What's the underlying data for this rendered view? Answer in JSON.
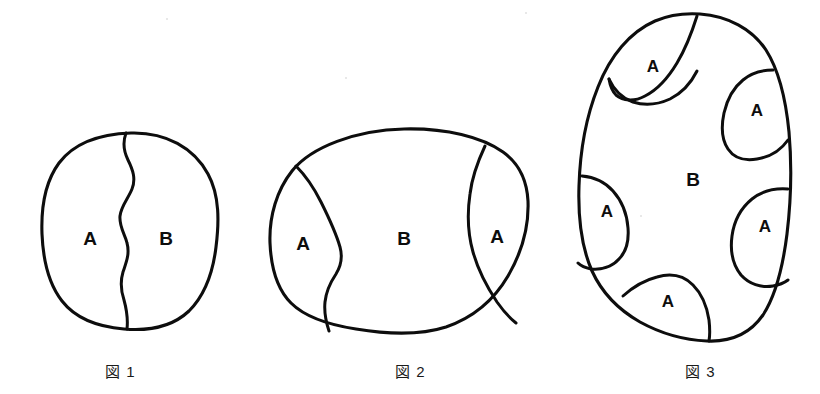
{
  "page": {
    "background_color": "#ffffff",
    "ink_color": "#0d0d0d",
    "width": 820,
    "height": 394
  },
  "figures": [
    {
      "id": "figure-1",
      "caption": "図 1",
      "caption_x": 105,
      "caption_y": 360,
      "shape": "rounded-blob",
      "regions": [
        {
          "label": "A",
          "x": 90,
          "y": 240
        },
        {
          "label": "B",
          "x": 166,
          "y": 240
        }
      ],
      "divider_count": 1,
      "description": "単一の波状境界で A と B の二領域に分割"
    },
    {
      "id": "figure-2",
      "caption": "図 2",
      "caption_x": 395,
      "caption_y": 360,
      "shape": "wide-oval-blob",
      "regions": [
        {
          "label": "A",
          "x": 303,
          "y": 245
        },
        {
          "label": "B",
          "x": 404,
          "y": 240
        },
        {
          "label": "A",
          "x": 497,
          "y": 238
        }
      ],
      "divider_count": 2,
      "description": "二本の境界で左右に A 領域、中央に B 領域"
    },
    {
      "id": "figure-3",
      "caption": "図 3",
      "caption_x": 685,
      "caption_y": 360,
      "shape": "egg-blob",
      "regions": [
        {
          "label": "A",
          "x": 653,
          "y": 68
        },
        {
          "label": "A",
          "x": 757,
          "y": 112
        },
        {
          "label": "B",
          "x": 693,
          "y": 181
        },
        {
          "label": "A",
          "x": 607,
          "y": 213
        },
        {
          "label": "A",
          "x": 765,
          "y": 228
        },
        {
          "label": "A",
          "x": 668,
          "y": 303
        }
      ],
      "divider_count": 5,
      "description": "周縁に五つの A 領域、中央に B 領域"
    }
  ],
  "labels": {
    "region_a": "A",
    "region_b": "B"
  }
}
